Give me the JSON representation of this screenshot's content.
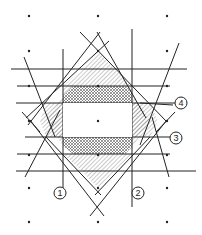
{
  "diagram": {
    "colors": {
      "line": "#222222",
      "hatch": "#555555",
      "background": "#ffffff"
    },
    "grid_dots": [
      [
        29,
        16
      ],
      [
        98,
        16
      ],
      [
        167,
        16
      ],
      [
        29,
        51
      ],
      [
        98,
        51
      ],
      [
        167,
        51
      ],
      [
        29,
        86
      ],
      [
        98,
        86
      ],
      [
        167,
        86
      ],
      [
        29,
        121
      ],
      [
        98,
        121
      ],
      [
        167,
        121
      ],
      [
        29,
        155
      ],
      [
        98,
        155
      ],
      [
        167,
        155
      ],
      [
        29,
        188
      ],
      [
        98,
        188
      ],
      [
        167,
        188
      ],
      [
        29,
        222
      ],
      [
        98,
        222
      ],
      [
        167,
        222
      ]
    ],
    "labels": [
      {
        "id": "1",
        "text": "1",
        "x": 60,
        "y": 193
      },
      {
        "id": "2",
        "text": "2",
        "x": 138,
        "y": 193
      },
      {
        "id": "3",
        "text": "3",
        "x": 176,
        "y": 138
      },
      {
        "id": "4",
        "text": "4",
        "x": 181,
        "y": 103
      }
    ]
  }
}
